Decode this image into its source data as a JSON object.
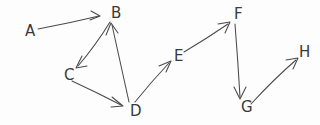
{
  "diagram": {
    "type": "directed-graph",
    "background_color": "#fdfdfd",
    "ink_color": "#4a4a4a",
    "label_color": "#3a3a3a",
    "nodes": [
      {
        "id": "A",
        "label": "A",
        "x": 25,
        "y": 31
      },
      {
        "id": "B",
        "label": "B",
        "x": 111,
        "y": 13
      },
      {
        "id": "C",
        "label": "C",
        "x": 64,
        "y": 75
      },
      {
        "id": "D",
        "label": "D",
        "x": 130,
        "y": 111
      },
      {
        "id": "E",
        "label": "E",
        "x": 174,
        "y": 56
      },
      {
        "id": "F",
        "label": "F",
        "x": 234,
        "y": 14
      },
      {
        "id": "G",
        "label": "G",
        "x": 241,
        "y": 107
      },
      {
        "id": "H",
        "label": "H",
        "x": 299,
        "y": 52
      }
    ],
    "edges": [
      {
        "id": "A-B",
        "from": "A",
        "to": "B",
        "directed": true,
        "path": "M 38 29 Q 70 23 99 16",
        "arrow": "M 91 11 L 100 16 L 90 20"
      },
      {
        "id": "B-C",
        "from": "B",
        "to": "C",
        "directed": true,
        "path": "M 110 22 Q 96 45 78 66",
        "arrow": "M 82 56 L 76 68 L 87 66"
      },
      {
        "id": "C-D",
        "from": "C",
        "to": "D",
        "directed": true,
        "path": "M 72 81 Q 98 93 121 105",
        "arrow": "M 112 97 L 123 106 L 111 107"
      },
      {
        "id": "D-B",
        "from": "D",
        "to": "B",
        "directed": true,
        "path": "M 129 102 Q 120 62 112 25",
        "arrow": "M 106 35 L 111 23 L 118 33"
      },
      {
        "id": "D-E",
        "from": "D",
        "to": "E",
        "directed": true,
        "path": "M 135 102 Q 152 81 169 63",
        "arrow": "M 159 66 L 171 61 L 166 72"
      },
      {
        "id": "E-F",
        "from": "E",
        "to": "F",
        "directed": true,
        "path": "M 184 52 Q 206 39 228 24",
        "arrow": "M 218 24 L 230 22 L 225 33"
      },
      {
        "id": "F-G",
        "from": "F",
        "to": "G",
        "directed": true,
        "path": "M 235 24 Q 238 62 240 97",
        "arrow": "M 234 87 L 240 99 L 246 87"
      },
      {
        "id": "G-H",
        "from": "G",
        "to": "H",
        "directed": true,
        "path": "M 251 104 Q 274 79 296 60",
        "arrow": "M 286 60 L 298 58 L 293 69"
      }
    ]
  }
}
